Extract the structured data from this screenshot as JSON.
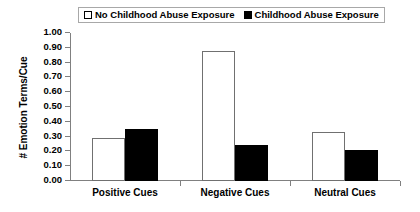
{
  "chart_data": {
    "type": "bar",
    "title": "",
    "xlabel": "",
    "ylabel": "# Emotion Terms/Cue",
    "ylim": [
      0,
      1.0
    ],
    "ytick_step": 0.1,
    "grid": false,
    "legend_position": "top",
    "categories": [
      "Positive Cues",
      "Negative Cues",
      "Neutral Cues"
    ],
    "series": [
      {
        "name": "No Childhood Abuse Exposure",
        "style": "open",
        "color": "#ffffff",
        "edge_color": "#707070",
        "values": [
          0.29,
          0.88,
          0.33
        ]
      },
      {
        "name": "Childhood Abuse Exposure",
        "style": "filled",
        "color": "#000000",
        "edge_color": "#000000",
        "values": [
          0.35,
          0.24,
          0.21
        ]
      }
    ],
    "ytick_labels": [
      "1.00",
      "0.90",
      "0.80",
      "0.70",
      "0.60",
      "0.50",
      "0.40",
      "0.30",
      "0.20",
      "0.10",
      "0.00"
    ],
    "ytick_values": [
      1.0,
      0.9,
      0.8,
      0.7,
      0.6,
      0.5,
      0.4,
      0.3,
      0.2,
      0.1,
      0.0
    ]
  },
  "legend": {
    "items": [
      {
        "label": "No Childhood Abuse Exposure",
        "swatch": "open-square-icon"
      },
      {
        "label": "Childhood Abuse Exposure",
        "swatch": "filled-square-icon"
      }
    ]
  }
}
